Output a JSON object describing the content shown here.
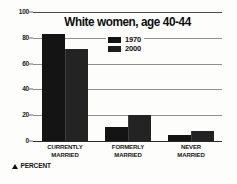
{
  "chart_data": {
    "type": "bar",
    "title": "White women, age 40-44",
    "xlabel": "",
    "ylabel": "PERCENT",
    "categories": [
      "CURRENTLY MARRIED",
      "FORMERLY MARRIED",
      "NEVER MARRIED"
    ],
    "category_lines": [
      [
        "CURRENTLY",
        "MARRIED"
      ],
      [
        "FORMERLY",
        "MARRIED"
      ],
      [
        "NEVER",
        "MARRIED"
      ]
    ],
    "series": [
      {
        "name": "1970",
        "values": [
          83,
          11,
          5
        ],
        "color": "#141414"
      },
      {
        "name": "2000",
        "values": [
          71,
          20,
          8
        ],
        "color": "#232323"
      }
    ],
    "ylim": [
      0,
      100
    ],
    "yticks": [
      0,
      20,
      40,
      60,
      80,
      100
    ],
    "ytick_labels": [
      "0",
      "20",
      "40",
      "60",
      "80",
      "100"
    ],
    "grid": true,
    "legend_position": "top-center"
  },
  "footer": {
    "marker_icon": "triangle-up-icon",
    "label": "PERCENT"
  }
}
